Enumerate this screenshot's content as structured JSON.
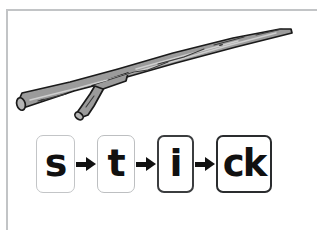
{
  "card": {
    "title": "stick",
    "word": "stick",
    "frame_color": "#c2c4c6",
    "background_color": "#ffffff"
  },
  "illustration": {
    "name": "stick-illustration",
    "subject": "wooden stick with a small side branch",
    "fill_color": "#9b9b9b",
    "outline_color": "#1a1a1a",
    "highlight_color": "#c9c9c9"
  },
  "phoneme_strip": {
    "name": "grapheme-sequence",
    "boxes": [
      {
        "label": "s",
        "border_color": "#c3c5c7"
      },
      {
        "label": "t",
        "border_color": "#bdbfc1"
      },
      {
        "label": "i",
        "border_color": "#3b3d3f"
      },
      {
        "label": "ck",
        "border_color": "#2a2c2e"
      }
    ],
    "separators": [
      {
        "label": "arrow-right"
      },
      {
        "label": "arrow-right"
      },
      {
        "label": "arrow-right"
      }
    ]
  }
}
